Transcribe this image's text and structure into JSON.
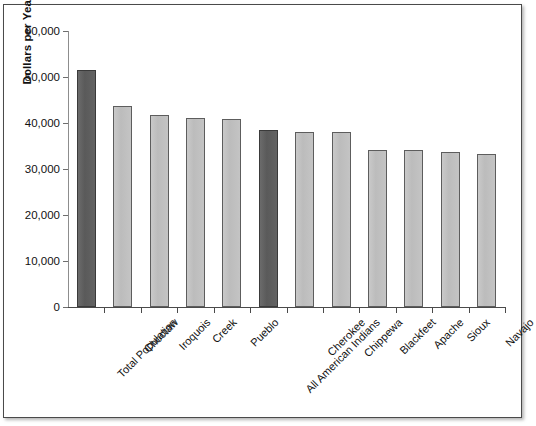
{
  "chart_data": {
    "type": "bar",
    "title": "",
    "xlabel": "",
    "ylabel": "Dollars per Year",
    "ylim": [
      0,
      60000
    ],
    "ytick_values": [
      0,
      10000,
      20000,
      30000,
      40000,
      50000,
      60000
    ],
    "ytick_labels": [
      "0",
      "10,000",
      "20,000",
      "30,000",
      "40,000",
      "50,000",
      "60,000"
    ],
    "grid": false,
    "legend": "none",
    "categories": [
      "Total Population",
      "Choctaw",
      "Iroquois",
      "Creek",
      "Pueblo",
      "All American Indians",
      "Cherokee",
      "Chippewa",
      "Blackfeet",
      "Apache",
      "Sioux",
      "Navajo"
    ],
    "values": [
      51500,
      43800,
      41800,
      41100,
      40900,
      38500,
      38100,
      38000,
      34200,
      34100,
      33800,
      33300
    ],
    "bar_styles": [
      "dark",
      "light",
      "light",
      "light",
      "light",
      "dark",
      "light",
      "light",
      "light",
      "light",
      "light",
      "light"
    ],
    "colors": {
      "bar_light": "#c2c2c2",
      "bar_dark": "#5f5f5f",
      "bar_outline": "#5d5d5d",
      "axis": "#4a4a4a",
      "text": "#111111",
      "plot_background": "#ffffff",
      "frame_border": "#4a4a4a"
    }
  }
}
